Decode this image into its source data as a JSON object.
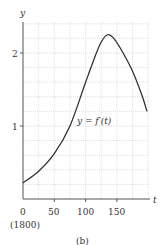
{
  "chart_data": {
    "type": "line",
    "title": "",
    "caption": "(b)",
    "xlabel": "t",
    "ylabel": "y",
    "xlim": [
      0,
      200
    ],
    "ylim": [
      0,
      2.4
    ],
    "x_ticks": [
      0,
      50,
      100,
      150
    ],
    "x_tick_labels": [
      "0",
      "50",
      "100",
      "150"
    ],
    "x_origin_note": "(1800)",
    "y_ticks": [
      1,
      2
    ],
    "y_tick_labels": [
      "1",
      "2"
    ],
    "grid": true,
    "grid_x_step": 25,
    "grid_y_step": 0.2,
    "series": [
      {
        "name": "y = f′(t)",
        "annotation": "y = f′(t)",
        "x": [
          0,
          25,
          50,
          75,
          100,
          115,
          125,
          135,
          145,
          160,
          175,
          190,
          198
        ],
        "values": [
          0.22,
          0.38,
          0.62,
          1.0,
          1.6,
          1.95,
          2.15,
          2.25,
          2.2,
          2.0,
          1.75,
          1.42,
          1.2
        ]
      }
    ]
  },
  "labels": {
    "y_axis": "y",
    "x_axis": "t",
    "tick_y_1": "1",
    "tick_y_2": "2",
    "tick_x_0": "0",
    "tick_x_50": "50",
    "tick_x_100": "100",
    "tick_x_150": "150",
    "origin_year": "(1800)",
    "curve_label": "y = f′(t)",
    "caption": "(b)"
  }
}
